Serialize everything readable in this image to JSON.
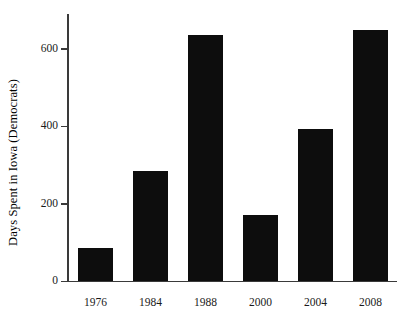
{
  "chart_data": {
    "type": "bar",
    "title": "",
    "xlabel": "",
    "ylabel": "Days Spent in Iowa (Democrats)",
    "categories": [
      "1976",
      "1984",
      "1988",
      "2000",
      "2004",
      "2008"
    ],
    "values": [
      85,
      285,
      636,
      172,
      393,
      650
    ],
    "ylim": [
      0,
      690
    ],
    "yticks": [
      0,
      200,
      400,
      600
    ],
    "ytick_labels": [
      "0",
      "200",
      "400",
      "600"
    ],
    "grid": false,
    "legend": false,
    "legend_position": "none",
    "bar_color": "#0d0d0d",
    "axis_color": "#3a3a3a",
    "background_color": "#ffffff"
  }
}
